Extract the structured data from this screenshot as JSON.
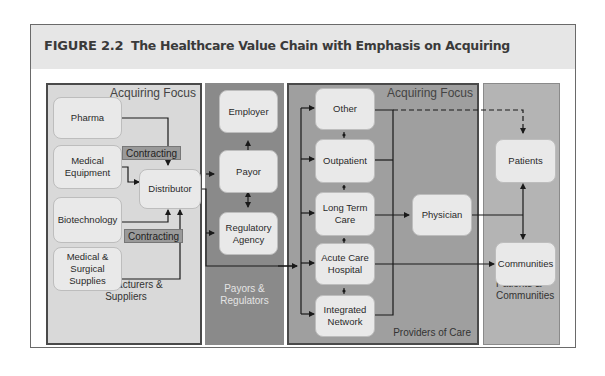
{
  "header": {
    "figure_number": "FIGURE 2.2",
    "title": "The Healthcare Value Chain with Emphasis on Acquiring"
  },
  "panels": {
    "manufacturers": {
      "focus_label": "Acquiring Focus",
      "label_line1": "Manufacturers &",
      "label_line2": "Suppliers",
      "boxes": {
        "pharma": "Pharma",
        "medical_equipment_1": "Medical",
        "medical_equipment_2": "Equipment",
        "biotechnology": "Biotechnology",
        "surgical_1": "Medical &",
        "surgical_2": "Surgical",
        "surgical_3": "Supplies",
        "distributor": "Distributor"
      },
      "tags": {
        "contracting_top": "Contracting",
        "contracting_bottom": "Contracting"
      }
    },
    "payors": {
      "label_line1": "Payors &",
      "label_line2": "Regulators",
      "boxes": {
        "employer": "Employer",
        "payor": "Payor",
        "regulatory_1": "Regulatory",
        "regulatory_2": "Agency"
      }
    },
    "providers": {
      "focus_label": "Acquiring Focus",
      "label": "Providers of Care",
      "boxes": {
        "other": "Other",
        "outpatient": "Outpatient",
        "long_term_1": "Long Term",
        "long_term_2": "Care",
        "acute_1": "Acute Care",
        "acute_2": "Hospital",
        "integrated_1": "Integrated",
        "integrated_2": "Network",
        "physician": "Physician"
      }
    },
    "patients": {
      "label_line1": "Patients &",
      "label_line2": "Communities",
      "boxes": {
        "patients": "Patients",
        "communities": "Communities"
      }
    }
  },
  "colors": {
    "header_bg": "#e6e6e6",
    "panel_manufacturers": "#d9d9d9",
    "panel_payors": "#8a8a8a",
    "panel_providers": "#9f9f9f",
    "panel_patients": "#b4b4b4",
    "box_fill": "#e9e9e9",
    "line": "#1a1a1a"
  }
}
